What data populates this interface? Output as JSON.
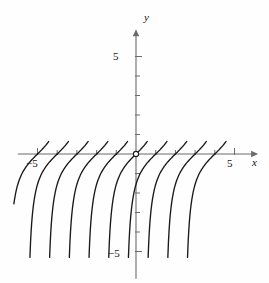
{
  "figure": {
    "kind": "direction-field-solution-curves",
    "width": 269,
    "height": 283,
    "background": "#fefefe",
    "curve_color": "#1a1a1a",
    "axis_color": "#6b6b6b",
    "tick_color": "#6b6b6b"
  },
  "axes": {
    "x_label": "x",
    "y_label": "y",
    "x_axis_pixel_y": 154,
    "y_axis_pixel_x": 136,
    "px_per_unit_x": 19.7,
    "px_per_unit_y": 19.5,
    "x_range": [
      -6.0,
      6.2
    ],
    "y_range": [
      -6.4,
      6.4
    ],
    "origin_marker": "open-circle",
    "arrowheads": [
      "x-positive",
      "y-positive"
    ]
  },
  "ticks": {
    "x_major": [
      {
        "value": -5,
        "label": "−5"
      },
      {
        "value": 5,
        "label": "5"
      }
    ],
    "y_major": [
      {
        "value": 5,
        "label": "5"
      },
      {
        "value": -5,
        "label": "−5"
      }
    ],
    "x_minor": [
      -4,
      -3,
      -2,
      -1,
      1,
      2,
      3,
      4
    ],
    "y_minor": [
      -4,
      -3,
      -2,
      -1,
      1,
      2,
      3,
      4
    ],
    "minor_tick_px": 4,
    "major_tick_px": 6
  },
  "chart_data": {
    "type": "line",
    "title": "",
    "xlabel": "x",
    "ylabel": "y",
    "xlim": [
      -6.0,
      6.2
    ],
    "ylim": [
      -6.4,
      6.4
    ],
    "grid": false,
    "legend": null,
    "curve_family": "y = tan(x - c)",
    "period": 3.14159,
    "zero_crossings_x": [
      -5.0,
      -4.0,
      -3.0,
      -2.0,
      -1.0,
      0.0,
      1.0,
      2.0,
      3.0,
      4.0
    ],
    "asymptotes_x": [
      -4.43,
      -3.43,
      -2.43,
      -1.43,
      -0.43,
      0.57,
      1.57,
      2.57,
      3.57,
      4.57
    ],
    "series": [
      {
        "name": "branch-1",
        "zero_x": -5.0,
        "asymptote_x": -4.43
      },
      {
        "name": "branch-2",
        "zero_x": -4.0,
        "asymptote_x": -3.43
      },
      {
        "name": "branch-3",
        "zero_x": -3.0,
        "asymptote_x": -2.43
      },
      {
        "name": "branch-4",
        "zero_x": -2.0,
        "asymptote_x": -1.43
      },
      {
        "name": "branch-5",
        "zero_x": -1.0,
        "asymptote_x": -0.43
      },
      {
        "name": "branch-6",
        "zero_x": 0.0,
        "asymptote_x": 0.57
      },
      {
        "name": "branch-7",
        "zero_x": 1.0,
        "asymptote_x": 1.57
      },
      {
        "name": "branch-8",
        "zero_x": 2.0,
        "asymptote_x": 2.57
      },
      {
        "name": "branch-9",
        "zero_x": 3.0,
        "asymptote_x": 3.57
      },
      {
        "name": "branch-10",
        "zero_x": 4.0,
        "asymptote_x": 4.57
      }
    ]
  }
}
